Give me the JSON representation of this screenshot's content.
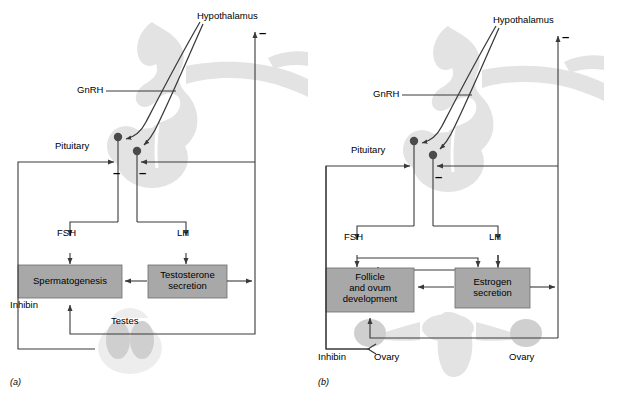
{
  "figure": {
    "type": "diagram",
    "colors": {
      "box_fill": "#a8a8a8",
      "box_stroke": "#6b6b6b",
      "line": "#3a3a3a",
      "anatomy_fill": "#e3e3e3",
      "anatomy_fill_dark": "#cfcfcf",
      "text": "#000000",
      "background": "#ffffff"
    }
  },
  "panels": [
    {
      "id": "a",
      "caption": "(a)",
      "title": "Male hypothalamic-pituitary-testicular axis",
      "labels": {
        "hypothalamus": "Hypothalamus",
        "gnrh": "GnRH",
        "pituitary": "Pituitary",
        "fsh": "FSH",
        "lh": "LH",
        "inhibin": "Inhibin",
        "gonad": "Testes"
      },
      "boxes": [
        {
          "id": "spermatogenesis",
          "line1": "Spermatogenesis",
          "line2": "",
          "line3": ""
        },
        {
          "id": "testosterone",
          "line1": "Testosterone",
          "line2": "secretion",
          "line3": ""
        }
      ],
      "negative_signs": [
        {
          "id": "neg-hypothalamus",
          "symbol": "–"
        },
        {
          "id": "neg-pituitary-left",
          "symbol": "–"
        },
        {
          "id": "neg-pituitary-right",
          "symbol": "–"
        }
      ]
    },
    {
      "id": "b",
      "caption": "(b)",
      "title": "Female hypothalamic-pituitary-ovarian axis",
      "labels": {
        "hypothalamus": "Hypothalamus",
        "gnrh": "GnRH",
        "pituitary": "Pituitary",
        "fsh": "FSH",
        "lh": "LH",
        "inhibin": "Inhibin",
        "gonad_left": "Ovary",
        "gonad_right": "Ovary"
      },
      "boxes": [
        {
          "id": "follicle",
          "line1": "Follicle",
          "line2": "and ovum",
          "line3": "development"
        },
        {
          "id": "estrogen",
          "line1": "Estrogen",
          "line2": "secretion",
          "line3": ""
        }
      ],
      "negative_signs": [
        {
          "id": "neg-hypothalamus",
          "symbol": "–"
        },
        {
          "id": "neg-pituitary-right",
          "symbol": "–"
        }
      ]
    }
  ]
}
